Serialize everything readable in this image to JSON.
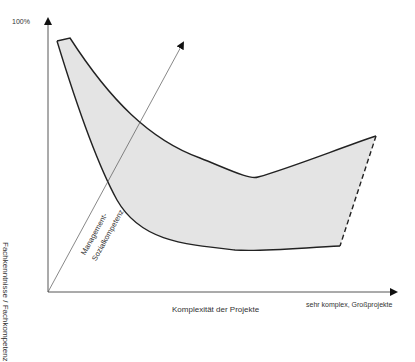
{
  "diagram": {
    "y_axis": {
      "top_label": "100%",
      "label": "Fachkenntnisse / Fachkompetenz"
    },
    "x_axis": {
      "label": "Komplexität der Projekte",
      "end_label": "sehr komplex, Großprojekte"
    },
    "diagonal_axis": {
      "label_line1": "Management-",
      "label_line2": "Sozialkompetenz"
    },
    "colors": {
      "axis": "#333333",
      "band_fill": "#e4e4e4",
      "band_stroke": "#222222"
    }
  }
}
